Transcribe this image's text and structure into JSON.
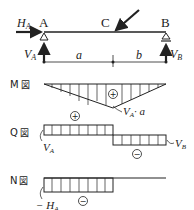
{
  "beam": {
    "point_a": "A",
    "point_b": "B",
    "point_c": "C",
    "ha_label": "H",
    "ha_sub": "A",
    "va_label": "V",
    "va_sub": "A",
    "vb_label": "V",
    "vb_sub": "B",
    "dim_a": "a",
    "dim_b": "b"
  },
  "moment_diagram": {
    "title_letter": "M",
    "title_mark": "図",
    "sign": "+",
    "peak_label": "V",
    "peak_sub": "A",
    "peak_suffix": "· a"
  },
  "shear_diagram": {
    "title_letter": "Q",
    "title_mark": "図",
    "sign_positive": "+",
    "sign_negative": "−",
    "left_label": "V",
    "left_sub": "A",
    "right_label": "V",
    "right_sub": "B"
  },
  "normal_diagram": {
    "title_letter": "N",
    "title_mark": "図",
    "sign_negative": "−",
    "left_label": "− H",
    "left_sub": "A"
  }
}
